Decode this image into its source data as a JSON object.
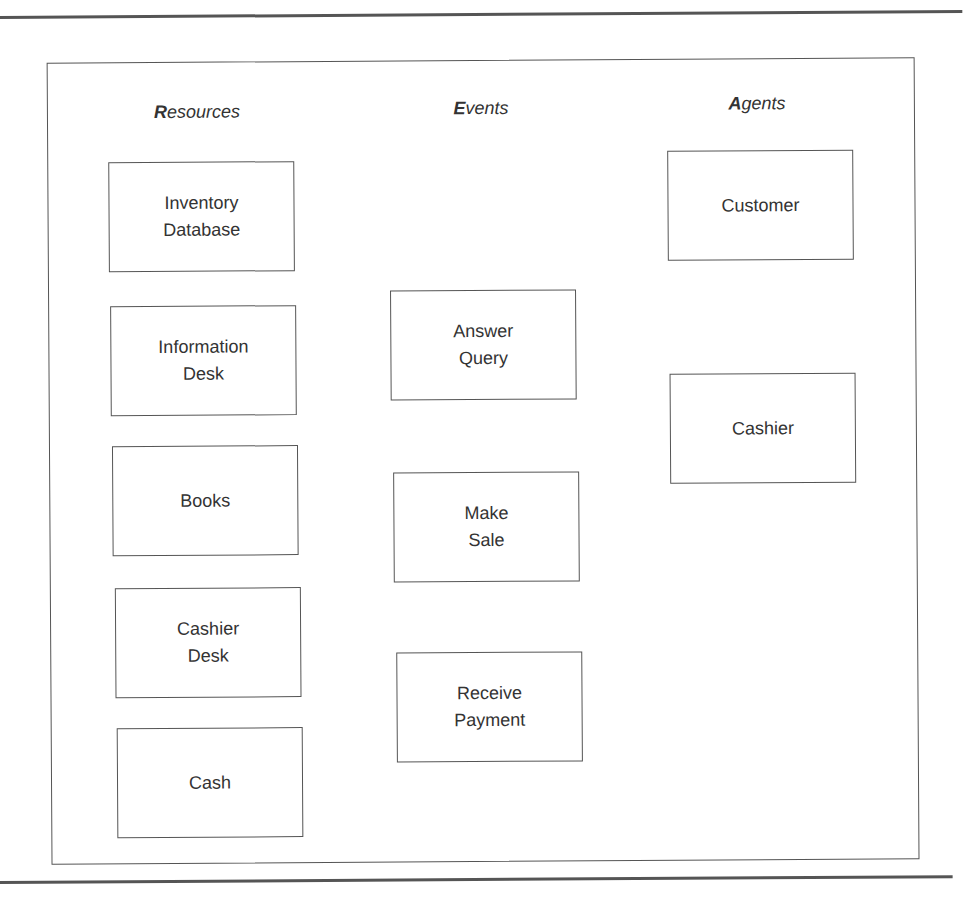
{
  "diagram": {
    "type": "REA model (Resources, Events, Agents)",
    "columns": [
      {
        "id": "resources",
        "header_initial": "R",
        "header_rest": "esources",
        "items": [
          {
            "label": "Inventory\nDatabase"
          },
          {
            "label": "Information\nDesk"
          },
          {
            "label": "Books"
          },
          {
            "label": "Cashier\nDesk"
          },
          {
            "label": "Cash"
          }
        ]
      },
      {
        "id": "events",
        "header_initial": "E",
        "header_rest": "vents",
        "items": [
          {
            "label": "Answer\nQuery"
          },
          {
            "label": "Make\nSale"
          },
          {
            "label": "Receive\nPayment"
          }
        ]
      },
      {
        "id": "agents",
        "header_initial": "A",
        "header_rest": "gents",
        "items": [
          {
            "label": "Customer"
          },
          {
            "label": "Cashier"
          }
        ]
      }
    ],
    "colors": {
      "line": "#555555",
      "text": "#333333",
      "background": "#ffffff"
    }
  }
}
